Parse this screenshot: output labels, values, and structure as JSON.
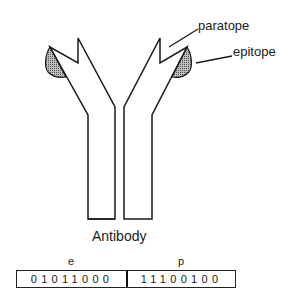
{
  "diagram": {
    "labels": {
      "paratope": "paratope",
      "epitope": "epitope",
      "caption": "Antibody"
    },
    "encoding": {
      "segments": [
        {
          "name": "e",
          "bits": "01011000"
        },
        {
          "name": "p",
          "bits": "11100100"
        }
      ]
    },
    "colors": {
      "stroke": "#1a1a1a",
      "epitope_fill": "#8a8a8a",
      "background": "#ffffff"
    }
  }
}
